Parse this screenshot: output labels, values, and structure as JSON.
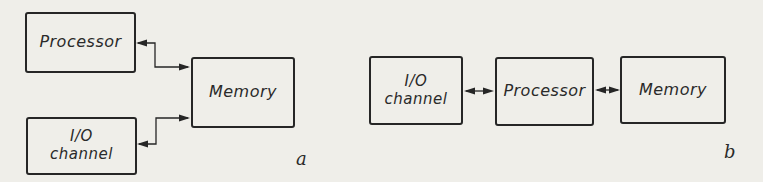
{
  "page": {
    "background_color": "#efeee9",
    "ink_color": "#262626"
  },
  "diagram_a": {
    "label": "a",
    "boxes": {
      "processor": {
        "label": "Processor"
      },
      "io_channel": {
        "line1": "I/O",
        "line2": "channel"
      },
      "memory": {
        "label": "Memory"
      }
    },
    "connections": [
      {
        "from": "processor",
        "to": "memory",
        "style": "bidirectional-elbow"
      },
      {
        "from": "io_channel",
        "to": "memory",
        "style": "bidirectional-elbow"
      }
    ]
  },
  "diagram_b": {
    "label": "b",
    "boxes": {
      "io_channel": {
        "line1": "I/O",
        "line2": "channel"
      },
      "processor": {
        "label": "Processor"
      },
      "memory": {
        "label": "Memory"
      }
    },
    "connections": [
      {
        "from": "io_channel",
        "to": "processor",
        "style": "bidirectional"
      },
      {
        "from": "processor",
        "to": "memory",
        "style": "bidirectional"
      }
    ]
  }
}
